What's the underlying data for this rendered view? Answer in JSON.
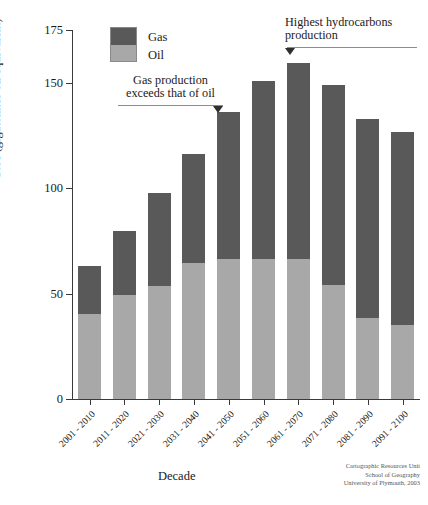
{
  "chart_data": {
    "type": "bar",
    "stacked": true,
    "title": "",
    "xlabel": "Decade",
    "ylabel": "Gtoe (gigatonnes oil equivalent)",
    "categories": [
      "2001 - 2010",
      "2011 - 2020",
      "2021 - 2030",
      "2031 - 2040",
      "2041 - 2050",
      "2051 - 2060",
      "2061 - 2070",
      "2071 - 2080",
      "2081 - 2090",
      "2091 - 2100"
    ],
    "series": [
      {
        "name": "Oil",
        "color": "#a8a8a8",
        "values": [
          40.5,
          49.5,
          53.5,
          64.5,
          66.5,
          66.5,
          66.5,
          54,
          38.5,
          35
        ]
      },
      {
        "name": "Gas",
        "color": "#595959",
        "values": [
          22.5,
          30,
          44,
          51.5,
          69.5,
          84.5,
          93,
          95,
          94.5,
          91.5
        ]
      }
    ],
    "totals": [
      63,
      79.5,
      97.5,
      116,
      136,
      151,
      159.5,
      149,
      133,
      126.5
    ],
    "ylim": [
      0,
      175
    ],
    "yticks": [
      0,
      50,
      100,
      150,
      175
    ],
    "ytick_labels": [
      "0",
      "50",
      "100",
      "150",
      "175"
    ],
    "grid": false,
    "legend_position": "top-left",
    "annotations": [
      {
        "id": "gas-exceeds",
        "text": "Gas production\nexceeds that of oil",
        "points_to_category": "2041 - 2050",
        "arrow_side": "right"
      },
      {
        "id": "highest-production",
        "text": "Highest hydrocarbons\nproduction",
        "points_to_category": "2061 - 2070",
        "arrow_side": "left"
      }
    ]
  },
  "legend": {
    "items": [
      {
        "label": "Gas",
        "color": "#595959"
      },
      {
        "label": "Oil",
        "color": "#a8a8a8"
      }
    ]
  },
  "axes": {
    "y_title": "Gtoe (gigatonnes oil equivalent)",
    "x_title": "Decade"
  },
  "credits": {
    "text": "Cartographic Resources Unit\nSchool of Geography\nUniversity of Plymouth, 2003"
  }
}
